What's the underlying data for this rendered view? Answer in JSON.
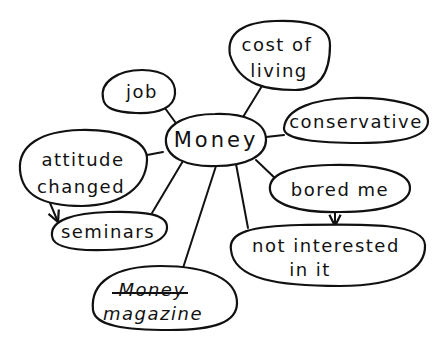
{
  "diagram": {
    "type": "mind-map",
    "style": "hand-drawn",
    "colors": {
      "ink": "#111111",
      "background": "#ffffff"
    },
    "central_node": {
      "id": "money",
      "label": "Money"
    },
    "nodes": [
      {
        "id": "job",
        "lines": [
          "job"
        ]
      },
      {
        "id": "cost_of_living",
        "lines": [
          "cost of",
          "living"
        ]
      },
      {
        "id": "conservative",
        "lines": [
          "conservative"
        ]
      },
      {
        "id": "attitude_changed",
        "lines": [
          "attitude",
          "changed"
        ]
      },
      {
        "id": "seminars",
        "lines": [
          "seminars"
        ]
      },
      {
        "id": "bored_me",
        "lines": [
          "bored me"
        ]
      },
      {
        "id": "not_interested",
        "lines": [
          "not interested",
          "in it"
        ]
      },
      {
        "id": "money_magazine",
        "lines": [
          "Money",
          "magazine"
        ],
        "underlined_line": 0
      }
    ],
    "connections": [
      {
        "from": "money",
        "to": "job",
        "type": "line"
      },
      {
        "from": "money",
        "to": "cost_of_living",
        "type": "line"
      },
      {
        "from": "money",
        "to": "conservative",
        "type": "line"
      },
      {
        "from": "money",
        "to": "attitude_changed",
        "type": "line"
      },
      {
        "from": "money",
        "to": "seminars",
        "type": "line"
      },
      {
        "from": "money",
        "to": "money_magazine",
        "type": "line"
      },
      {
        "from": "money",
        "to": "not_interested",
        "type": "line"
      },
      {
        "from": "money",
        "to": "bored_me",
        "type": "line"
      },
      {
        "from": "attitude_changed",
        "to": "seminars",
        "type": "arrow"
      },
      {
        "from": "bored_me",
        "to": "not_interested",
        "type": "arrow"
      }
    ]
  }
}
